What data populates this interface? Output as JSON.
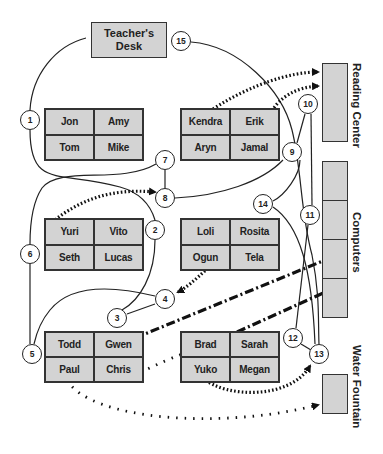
{
  "colors": {
    "desk_fill": "#d3d3d3",
    "stroke": "#222222",
    "background": "#ffffff"
  },
  "teacher_desk": {
    "label_line1": "Teacher's",
    "label_line2": "Desk"
  },
  "stations": {
    "reading_center": "Reading Center",
    "computers": "Computers",
    "water_fountain": "Water Fountain"
  },
  "groups": [
    {
      "id": "group-1",
      "students": [
        "Jon",
        "Amy",
        "Tom",
        "Mike"
      ]
    },
    {
      "id": "group-2",
      "students": [
        "Kendra",
        "Erik",
        "Aryn",
        "Jamal"
      ]
    },
    {
      "id": "group-3",
      "students": [
        "Yuri",
        "Vito",
        "Seth",
        "Lucas"
      ]
    },
    {
      "id": "group-4",
      "students": [
        "Loli",
        "Rosita",
        "Ogun",
        "Tela"
      ]
    },
    {
      "id": "group-5",
      "students": [
        "Todd",
        "Gwen",
        "Paul",
        "Chris"
      ]
    },
    {
      "id": "group-6",
      "students": [
        "Brad",
        "Sarah",
        "Yuko",
        "Megan"
      ]
    }
  ],
  "nodes": [
    "1",
    "2",
    "3",
    "4",
    "5",
    "6",
    "7",
    "8",
    "9",
    "10",
    "11",
    "12",
    "13",
    "14",
    "15"
  ],
  "legend_paths": {
    "solid": "teacher walking path",
    "dotted": "student movement",
    "dash_dot": "student movement to computers"
  }
}
